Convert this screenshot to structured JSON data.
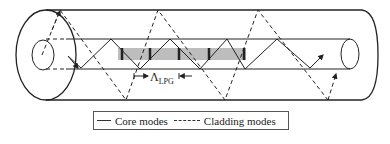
{
  "figure": {
    "grating_label_main": "Λ",
    "grating_label_sub": "LPG",
    "colors": {
      "line": "#222222",
      "grating_band": "#bdbdbd",
      "grating_mark": "#222222"
    }
  },
  "legend": {
    "core_label": "Core modes",
    "cladding_label": "Cladding modes"
  }
}
